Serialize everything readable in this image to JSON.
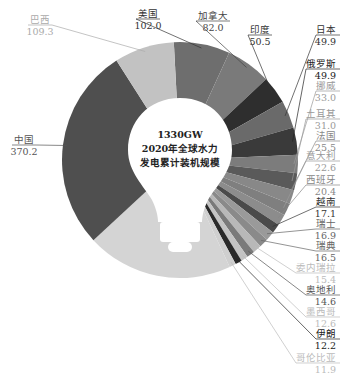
{
  "chart_data": {
    "type": "pie",
    "title": "2020年全球水力发电累计装机规模",
    "total_label": "1330GW",
    "center_text": [
      "1330GW",
      "2020年全球水力",
      "发电累计装机规模"
    ],
    "unit": "GW",
    "total": 1330,
    "categories": [
      "美国",
      "加拿大",
      "印度",
      "日本",
      "俄罗斯",
      "挪威",
      "土耳其",
      "法国",
      "意大利",
      "西班牙",
      "越南",
      "瑞士",
      "瑞典",
      "委内瑞拉",
      "奥地利",
      "墨西哥",
      "伊朗",
      "哥伦比亚",
      "其他",
      "中国",
      "巴西"
    ],
    "values": [
      102.0,
      82.0,
      50.5,
      49.9,
      49.9,
      33.0,
      31.0,
      25.5,
      22.6,
      20.4,
      17.1,
      16.9,
      16.5,
      15.4,
      14.6,
      12.6,
      12.2,
      11.9,
      266.5,
      370.2,
      109.3
    ],
    "value_labels": [
      "102.0",
      "82.0",
      "50.5",
      "49.9",
      "49.9",
      "33.0",
      "31.0",
      "25.5",
      "22.6",
      "20.4",
      "17.1",
      "16.9",
      "16.5",
      "15.4",
      "14.6",
      "12.6",
      "12.2",
      "11.9",
      "",
      "370.2",
      "109.3"
    ],
    "colors": [
      "#6e6e6e",
      "#7a7a7a",
      "#2e2e2e",
      "#6a6a6a",
      "#3a3a3a",
      "#7c7c7c",
      "#5a5a5a",
      "#888888",
      "#7f7f7f",
      "#8c8c8c",
      "#4a4a4a",
      "#9a9a9a",
      "#8a8a8a",
      "#b8b8b8",
      "#7a7a7a",
      "#c4c4c4",
      "#2a2a2a",
      "#cfcfcf",
      "#d4d4d4",
      "#4f4f4f",
      "#c2c2c2"
    ],
    "label_colors": [
      "#333",
      "#444",
      "#333",
      "#333",
      "#222",
      "#999",
      "#999",
      "#888",
      "#999",
      "#888",
      "#333",
      "#666",
      "#666",
      "#bbb",
      "#555",
      "#bbb",
      "#222",
      "#bbb",
      "",
      "#555",
      "#aaa"
    ],
    "start_angle_deg": -3,
    "legend": "none",
    "labels_position": "outside with leader lines"
  }
}
